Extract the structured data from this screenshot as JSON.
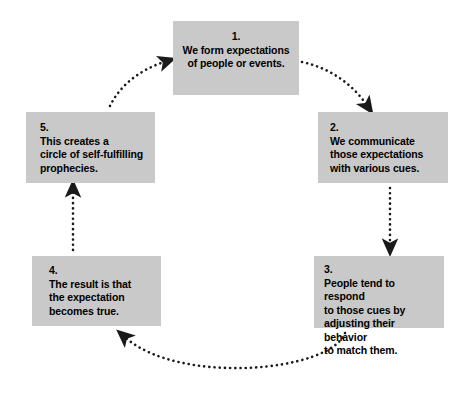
{
  "diagram": {
    "type": "cycle-flow-diagram",
    "background_color": "#ffffff",
    "node_fill_color": "#c9c9c9",
    "node_text_color": "#000000",
    "arrow_color": "#1a1a1a",
    "arrow_style": "dotted",
    "nodes": [
      {
        "id": "node-1",
        "number": "1.",
        "text": "We form expectations\nof people or events.",
        "align": "center"
      },
      {
        "id": "node-2",
        "number": "2.",
        "text": "We communicate\nthose expectations\nwith various cues.",
        "align": "left"
      },
      {
        "id": "node-3",
        "number": "3.",
        "text": "People tend to respond\nto those cues by\nadjusting their behavior\nto match them.",
        "align": "left"
      },
      {
        "id": "node-4",
        "number": "4.",
        "text": "The result is that\nthe expectation\nbecomes true.",
        "align": "left"
      },
      {
        "id": "node-5",
        "number": "5.",
        "text": "This creates a\ncircle of self-fulfilling\nprophecies.",
        "align": "left"
      }
    ],
    "connectors": [
      {
        "id": "arrow-1-to-2",
        "from": "node-1",
        "to": "node-2",
        "shape": "curve-clockwise",
        "style": "dotted"
      },
      {
        "id": "arrow-2-to-3",
        "from": "node-2",
        "to": "node-3",
        "shape": "vertical-down",
        "style": "dotted"
      },
      {
        "id": "arrow-3-to-4",
        "from": "node-3",
        "to": "node-4",
        "shape": "arc-bottom",
        "style": "dotted"
      },
      {
        "id": "arrow-4-to-5",
        "from": "node-4",
        "to": "node-5",
        "shape": "vertical-up",
        "style": "dotted"
      },
      {
        "id": "arrow-5-to-1",
        "from": "node-5",
        "to": "node-1",
        "shape": "curve-clockwise",
        "style": "dotted"
      }
    ]
  }
}
